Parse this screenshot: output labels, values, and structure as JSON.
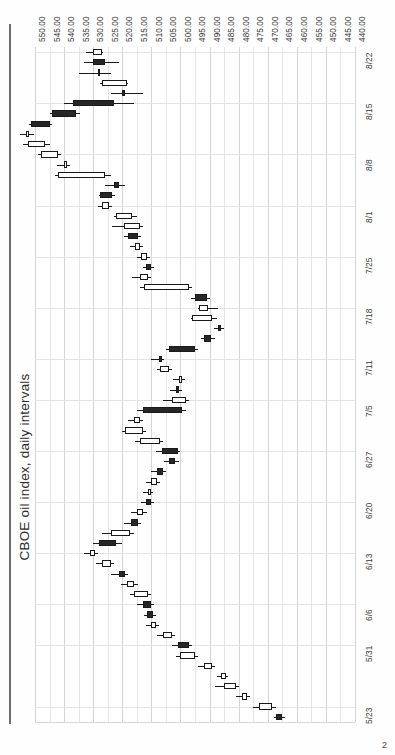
{
  "page": {
    "number": "2"
  },
  "chart_data": {
    "type": "candlestick",
    "title": "CBOE oil index, daily intervals",
    "orientation": "rotated-90-ccw",
    "xlabel": "",
    "ylabel": "",
    "grid": true,
    "legend": "none",
    "price_axis": {
      "position": "top",
      "min": 440.0,
      "max": 550.0,
      "step": 5.0,
      "direction": "descending-left-to-right",
      "tick_labels": [
        "550.00",
        "545.00",
        "540.00",
        "535.00",
        "530.00",
        "525.00",
        "520.00",
        "515.00",
        "510.00",
        "505.00",
        "500.00",
        "495.00",
        "490.00",
        "485.00",
        "480.00",
        "475.00",
        "470.00",
        "465.00",
        "460.00",
        "455.00",
        "450.00",
        "445.00",
        "440.00"
      ]
    },
    "date_axis": {
      "position": "right",
      "direction": "descending-top-to-bottom",
      "tick_labels": [
        "8/22",
        "8/15",
        "8/8",
        "8/1",
        "7/25",
        "7/18",
        "7/11",
        "7/5",
        "6/27",
        "6/20",
        "6/13",
        "6/6",
        "5/31",
        "5/23"
      ]
    },
    "colors": {
      "up_fill": "#ffffff",
      "down_fill": "#262626",
      "outline": "#1a1a1a",
      "grid": "#dcdcdc",
      "axis": "#6e6e6e",
      "text": "#3a3a3a"
    },
    "ohlc": [
      {
        "date": "8/22",
        "open": 530.0,
        "high": 532.5,
        "low": 526.5,
        "close": 527.0,
        "dir": "up"
      },
      {
        "date": "8/21",
        "open": 526.0,
        "high": 533.0,
        "low": 521.0,
        "close": 530.0,
        "dir": "down"
      },
      {
        "date": "8/20",
        "open": 528.5,
        "high": 535.0,
        "low": 524.0,
        "close": 528.0,
        "dir": "up"
      },
      {
        "date": "8/19",
        "open": 527.0,
        "high": 527.5,
        "low": 518.0,
        "close": 518.5,
        "dir": "up"
      },
      {
        "date": "8/16",
        "open": 519.0,
        "high": 524.0,
        "low": 513.0,
        "close": 520.0,
        "dir": "down"
      },
      {
        "date": "8/15",
        "open": 537.0,
        "high": 540.0,
        "low": 516.0,
        "close": 523.0,
        "dir": "down"
      },
      {
        "date": "8/14",
        "open": 544.0,
        "high": 545.0,
        "low": 534.5,
        "close": 536.0,
        "dir": "down"
      },
      {
        "date": "8/13",
        "open": 551.5,
        "high": 552.0,
        "low": 544.0,
        "close": 545.0,
        "dir": "down"
      },
      {
        "date": "8/12",
        "open": 553.0,
        "high": 555.0,
        "low": 550.5,
        "close": 552.0,
        "dir": "up"
      },
      {
        "date": "8/9",
        "open": 552.5,
        "high": 554.0,
        "low": 545.0,
        "close": 546.5,
        "dir": "up"
      },
      {
        "date": "8/8",
        "open": 548.0,
        "high": 549.0,
        "low": 541.0,
        "close": 542.0,
        "dir": "up"
      },
      {
        "date": "8/7",
        "open": 540.0,
        "high": 542.5,
        "low": 538.0,
        "close": 539.0,
        "dir": "up"
      },
      {
        "date": "8/6",
        "open": 542.0,
        "high": 543.0,
        "low": 524.0,
        "close": 526.0,
        "dir": "up"
      },
      {
        "date": "8/5",
        "open": 523.0,
        "high": 526.0,
        "low": 519.0,
        "close": 521.0,
        "dir": "down"
      },
      {
        "date": "8/2",
        "open": 527.5,
        "high": 528.0,
        "low": 522.5,
        "close": 523.5,
        "dir": "down"
      },
      {
        "date": "8/1",
        "open": 527.0,
        "high": 528.5,
        "low": 523.5,
        "close": 524.5,
        "dir": "up"
      },
      {
        "date": "7/31",
        "open": 522.0,
        "high": 523.0,
        "low": 515.0,
        "close": 516.5,
        "dir": "up"
      },
      {
        "date": "7/30",
        "open": 519.5,
        "high": 523.5,
        "low": 513.0,
        "close": 514.0,
        "dir": "up"
      },
      {
        "date": "7/29",
        "open": 518.0,
        "high": 519.5,
        "low": 513.5,
        "close": 514.5,
        "dir": "down"
      },
      {
        "date": "7/26",
        "open": 515.5,
        "high": 517.5,
        "low": 513.0,
        "close": 514.0,
        "dir": "up"
      },
      {
        "date": "7/25",
        "open": 513.5,
        "high": 515.0,
        "low": 510.5,
        "close": 511.5,
        "dir": "up"
      },
      {
        "date": "7/24",
        "open": 512.0,
        "high": 513.0,
        "low": 509.0,
        "close": 510.0,
        "dir": "down"
      },
      {
        "date": "7/23",
        "open": 514.0,
        "high": 516.5,
        "low": 510.0,
        "close": 511.0,
        "dir": "up"
      },
      {
        "date": "7/22",
        "open": 512.5,
        "high": 514.0,
        "low": 496.0,
        "close": 497.0,
        "dir": "up"
      },
      {
        "date": "7/19",
        "open": 495.0,
        "high": 496.5,
        "low": 490.0,
        "close": 491.0,
        "dir": "down"
      },
      {
        "date": "7/18",
        "open": 493.5,
        "high": 494.0,
        "low": 487.0,
        "close": 490.5,
        "dir": "up"
      },
      {
        "date": "7/17",
        "open": 496.0,
        "high": 496.5,
        "low": 487.5,
        "close": 489.0,
        "dir": "up"
      },
      {
        "date": "7/16",
        "open": 487.0,
        "high": 488.5,
        "low": 485.0,
        "close": 486.0,
        "dir": "down"
      },
      {
        "date": "7/15",
        "open": 492.0,
        "high": 493.0,
        "low": 488.0,
        "close": 489.5,
        "dir": "down"
      },
      {
        "date": "7/12",
        "open": 504.0,
        "high": 505.0,
        "low": 494.0,
        "close": 495.0,
        "dir": "down"
      },
      {
        "date": "7/11",
        "open": 507.5,
        "high": 510.0,
        "low": 505.5,
        "close": 506.5,
        "dir": "down"
      },
      {
        "date": "7/10",
        "open": 507.0,
        "high": 508.0,
        "low": 503.0,
        "close": 504.0,
        "dir": "up"
      },
      {
        "date": "7/9",
        "open": 500.5,
        "high": 502.5,
        "low": 498.5,
        "close": 499.5,
        "dir": "up"
      },
      {
        "date": "7/8",
        "open": 501.5,
        "high": 503.5,
        "low": 499.5,
        "close": 500.5,
        "dir": "down"
      },
      {
        "date": "7/5",
        "open": 503.0,
        "high": 506.0,
        "low": 497.0,
        "close": 498.0,
        "dir": "up"
      },
      {
        "date": "7/3",
        "open": 513.0,
        "high": 515.0,
        "low": 498.0,
        "close": 499.5,
        "dir": "down"
      },
      {
        "date": "7/2",
        "open": 516.0,
        "high": 518.0,
        "low": 513.0,
        "close": 514.0,
        "dir": "up"
      },
      {
        "date": "7/1",
        "open": 519.0,
        "high": 520.0,
        "low": 512.0,
        "close": 513.0,
        "dir": "up"
      },
      {
        "date": "6/28",
        "open": 514.0,
        "high": 515.5,
        "low": 506.0,
        "close": 507.0,
        "dir": "up"
      },
      {
        "date": "6/27",
        "open": 506.5,
        "high": 508.5,
        "low": 500.0,
        "close": 501.0,
        "dir": "down"
      },
      {
        "date": "6/26",
        "open": 504.0,
        "high": 505.5,
        "low": 500.5,
        "close": 502.0,
        "dir": "down"
      },
      {
        "date": "6/25",
        "open": 508.0,
        "high": 510.0,
        "low": 505.0,
        "close": 506.0,
        "dir": "down"
      },
      {
        "date": "6/24",
        "open": 510.0,
        "high": 512.0,
        "low": 507.0,
        "close": 508.0,
        "dir": "up"
      },
      {
        "date": "6/21",
        "open": 511.0,
        "high": 513.0,
        "low": 509.5,
        "close": 510.5,
        "dir": "up"
      },
      {
        "date": "6/20",
        "open": 512.0,
        "high": 513.5,
        "low": 509.0,
        "close": 510.0,
        "dir": "down"
      },
      {
        "date": "6/19",
        "open": 515.0,
        "high": 517.0,
        "low": 511.5,
        "close": 513.0,
        "dir": "up"
      },
      {
        "date": "6/18",
        "open": 517.0,
        "high": 519.5,
        "low": 513.5,
        "close": 514.5,
        "dir": "down"
      },
      {
        "date": "6/17",
        "open": 524.0,
        "high": 527.0,
        "low": 516.0,
        "close": 517.5,
        "dir": "up"
      },
      {
        "date": "6/14",
        "open": 528.0,
        "high": 530.0,
        "low": 520.0,
        "close": 522.0,
        "dir": "down"
      },
      {
        "date": "6/13",
        "open": 531.0,
        "high": 533.0,
        "low": 528.5,
        "close": 529.5,
        "dir": "up"
      },
      {
        "date": "6/12",
        "open": 527.0,
        "high": 529.0,
        "low": 523.0,
        "close": 524.0,
        "dir": "up"
      },
      {
        "date": "6/11",
        "open": 521.0,
        "high": 524.0,
        "low": 518.0,
        "close": 519.0,
        "dir": "down"
      },
      {
        "date": "6/10",
        "open": 518.5,
        "high": 520.5,
        "low": 514.5,
        "close": 516.0,
        "dir": "up"
      },
      {
        "date": "6/7",
        "open": 516.0,
        "high": 517.5,
        "low": 510.0,
        "close": 511.0,
        "dir": "up"
      },
      {
        "date": "6/6",
        "open": 513.0,
        "high": 515.0,
        "low": 509.0,
        "close": 510.0,
        "dir": "down"
      },
      {
        "date": "6/5",
        "open": 511.5,
        "high": 512.5,
        "low": 508.5,
        "close": 509.5,
        "dir": "down"
      },
      {
        "date": "6/4",
        "open": 510.0,
        "high": 512.0,
        "low": 507.5,
        "close": 508.5,
        "dir": "up"
      },
      {
        "date": "6/3",
        "open": 506.0,
        "high": 508.0,
        "low": 502.0,
        "close": 503.0,
        "dir": "up"
      },
      {
        "date": "5/31",
        "open": 501.0,
        "high": 503.0,
        "low": 496.0,
        "close": 497.0,
        "dir": "down"
      },
      {
        "date": "5/30",
        "open": 500.0,
        "high": 501.5,
        "low": 494.0,
        "close": 495.0,
        "dir": "up"
      },
      {
        "date": "5/29",
        "open": 492.0,
        "high": 494.0,
        "low": 488.0,
        "close": 489.0,
        "dir": "up"
      },
      {
        "date": "5/28",
        "open": 486.0,
        "high": 487.5,
        "low": 483.5,
        "close": 484.5,
        "dir": "up"
      },
      {
        "date": "5/25",
        "open": 485.0,
        "high": 488.0,
        "low": 480.0,
        "close": 481.0,
        "dir": "up"
      },
      {
        "date": "5/24",
        "open": 479.0,
        "high": 481.0,
        "low": 476.0,
        "close": 477.0,
        "dir": "up"
      },
      {
        "date": "5/23",
        "open": 473.0,
        "high": 475.0,
        "low": 467.0,
        "close": 468.5,
        "dir": "up"
      },
      {
        "date": "5/22",
        "open": 467.0,
        "high": 468.0,
        "low": 464.0,
        "close": 465.0,
        "dir": "down"
      }
    ]
  }
}
